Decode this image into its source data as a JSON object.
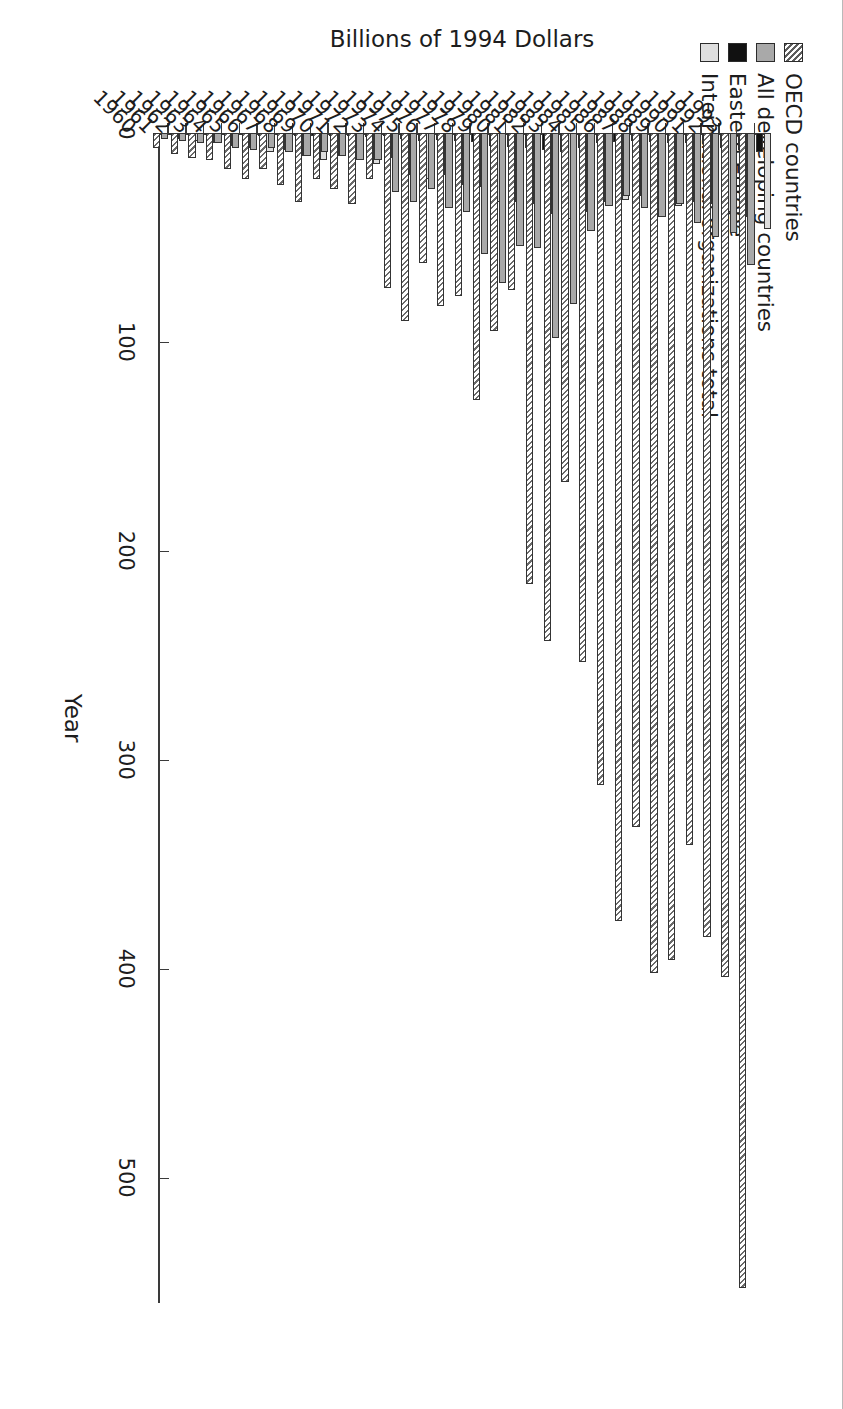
{
  "chart_data": {
    "type": "bar",
    "title": "",
    "xlabel": "Year",
    "ylabel": "Billions of 1994 Dollars",
    "orientation": "vertical-grouped-rendered-rotated-90",
    "grid": false,
    "legend_position": "top-left",
    "ylim": [
      0,
      560
    ],
    "yticks": [
      0,
      100,
      200,
      300,
      400,
      500
    ],
    "ytick_labels": [
      "0",
      "100",
      "200",
      "300",
      "400",
      "500"
    ],
    "categories": [
      "1960",
      "1961",
      "1962",
      "1963",
      "1964",
      "1965",
      "1966",
      "1967",
      "1968",
      "1969",
      "1970",
      "1971",
      "1972",
      "1973",
      "1974",
      "1975",
      "1976",
      "1977",
      "1978",
      "1979",
      "1980",
      "1981",
      "1982",
      "1983",
      "1984",
      "1985",
      "1986",
      "1987",
      "1988",
      "1989",
      "1990",
      "1991",
      "1992",
      "1993"
    ],
    "series": [
      {
        "name": "OECD countries",
        "color": "#ffffff",
        "pattern": "diagonal-hatch",
        "values": [
          7,
          10,
          12,
          13,
          17,
          22,
          17,
          25,
          33,
          22,
          27,
          34,
          22,
          74,
          90,
          62,
          83,
          78,
          128,
          95,
          75,
          216,
          243,
          167,
          253,
          312,
          377,
          332,
          402,
          396,
          341,
          385,
          404,
          553
        ]
      },
      {
        "name": "All developing countries",
        "color": "#a9a9a9",
        "pattern": "solid",
        "values": [
          3,
          4,
          5,
          5,
          7,
          8,
          7,
          9,
          11,
          9,
          11,
          13,
          13,
          28,
          33,
          27,
          36,
          38,
          58,
          72,
          54,
          55,
          98,
          82,
          47,
          35,
          30,
          36,
          40,
          34,
          43,
          50,
          48,
          63
        ]
      },
      {
        "name": "Eastern Europe",
        "color": "#111111",
        "pattern": "solid",
        "values": [
          0.5,
          0.6,
          0.7,
          0.8,
          1,
          1.2,
          1,
          1.3,
          1.6,
          1.3,
          1.5,
          1.8,
          1.6,
          3,
          4,
          3.5,
          4,
          4.5,
          6,
          6.5,
          7,
          8,
          9,
          7,
          5,
          4.5,
          4,
          4.5,
          5,
          5,
          5.5,
          7,
          8,
          9
        ]
      },
      {
        "name": "International organizations total",
        "color": "#dedede",
        "pattern": "solid",
        "values": [
          3,
          4,
          5,
          6,
          7,
          9,
          8,
          11,
          13,
          11,
          13,
          15,
          12,
          20,
          22,
          20,
          25,
          26,
          33,
          33,
          34,
          39,
          41,
          38,
          33,
          32,
          30,
          33,
          35,
          33,
          34,
          38,
          40,
          46
        ]
      }
    ],
    "legend": [
      {
        "label": "OECD countries",
        "swatch": "hatch"
      },
      {
        "label": "All developing countries",
        "swatch": "gray"
      },
      {
        "label": "Eastern Europe",
        "swatch": "black"
      },
      {
        "label": "International organizations total",
        "swatch": "light"
      }
    ]
  }
}
